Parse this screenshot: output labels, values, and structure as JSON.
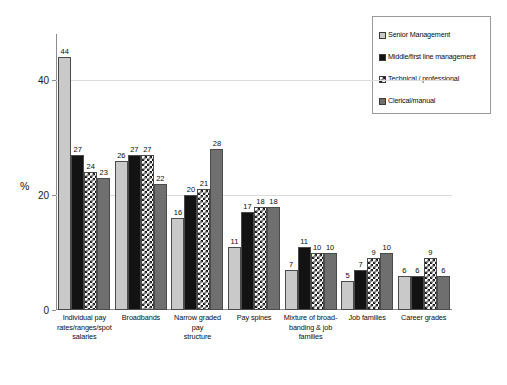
{
  "chart_data": {
    "type": "bar",
    "title": "",
    "subtitle": "",
    "xlabel": "",
    "ylabel": "%",
    "ylim": [
      0,
      48
    ],
    "yticks": [
      0,
      20,
      40
    ],
    "ytick_labels": [
      "0",
      "20",
      "40"
    ],
    "grid": true,
    "legend_position": "top-right",
    "categories": [
      "Individual pay rates/ranges/spot salaries",
      "Broadbands",
      "Narrow graded pay structure",
      "Pay spines",
      "Mixture of broad-banding & job families",
      "Job families",
      "Career grades"
    ],
    "category_lines": [
      [
        "Individual pay",
        "rates/ranges/spot",
        "salaries"
      ],
      [
        "Broadbands"
      ],
      [
        "Narrow graded pay",
        "structure"
      ],
      [
        "Pay spines"
      ],
      [
        "Mixture of broad-",
        "banding & job",
        "families"
      ],
      [
        "Job families"
      ],
      [
        "Career grades"
      ]
    ],
    "series": [
      {
        "name": "Senior Management",
        "swatch": "light-gray",
        "color": "#c9c9c9",
        "values": [
          44,
          26,
          16,
          11,
          7,
          5,
          6
        ]
      },
      {
        "name": "Middle/first line management",
        "swatch": "black",
        "color": "#131313",
        "values": [
          27,
          27,
          20,
          17,
          11,
          7,
          6
        ]
      },
      {
        "name": "Technical / professional",
        "swatch": "checkered",
        "color": "#1a1a1a",
        "values": [
          24,
          27,
          21,
          18,
          10,
          9,
          9
        ]
      },
      {
        "name": "Clerical/manual",
        "swatch": "dark-gray",
        "color": "#6f6f6f",
        "values": [
          23,
          22,
          28,
          18,
          10,
          10,
          6
        ]
      }
    ]
  }
}
